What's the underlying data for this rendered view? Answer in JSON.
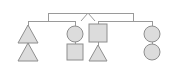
{
  "diagram": {
    "type": "genogram",
    "canvas": {
      "width": 177,
      "height": 68
    },
    "palette": {
      "background": "#ffffff",
      "shape_fill": "#dcdcdc",
      "shape_stroke": "#8e8e8e",
      "line_stroke": "#9a9a9a"
    },
    "apex": {
      "symbol": "∧",
      "name": "descent-apex",
      "x": 88,
      "y": 13,
      "half_width": 7,
      "height": 8
    },
    "top_bar": {
      "x1": 48,
      "x2": 133,
      "y": 13
    },
    "top_drops": [
      {
        "x": 48,
        "y1": 13,
        "y2": 21
      },
      {
        "x": 133,
        "y1": 13,
        "y2": 21
      }
    ],
    "sibling_bars": [
      {
        "name": "left-sibling-bar",
        "x1": 28,
        "x2": 75,
        "y": 21
      },
      {
        "name": "right-sibling-bar",
        "x1": 98,
        "x2": 152,
        "y": 21
      }
    ],
    "branches": [
      {
        "name": "branch-1",
        "x": 28,
        "stem": {
          "y1": 21,
          "y2": 30
        },
        "connector": {
          "y1": 38,
          "y2": 46
        },
        "top": {
          "shape": "triangle",
          "cx": 28,
          "cy": 34,
          "size": 9,
          "label": "triangle-node"
        },
        "bottom": {
          "shape": "triangle",
          "cx": 28,
          "cy": 52,
          "size": 9,
          "label": "triangle-node"
        }
      },
      {
        "name": "branch-2",
        "x": 75,
        "stem": {
          "y1": 21,
          "y2": 27
        },
        "connector": {
          "y1": 40,
          "y2": 44
        },
        "top": {
          "shape": "circle",
          "cx": 75,
          "cy": 34,
          "size": 8,
          "label": "circle-node"
        },
        "bottom": {
          "shape": "square",
          "cx": 75,
          "cy": 52,
          "size": 8,
          "label": "square-node"
        }
      },
      {
        "name": "branch-3",
        "x": 98,
        "stem": {
          "y1": 21,
          "y2": 26
        },
        "connector": {
          "y1": 41,
          "y2": 46
        },
        "top": {
          "shape": "square",
          "cx": 98,
          "cy": 33,
          "size": 9,
          "label": "square-node"
        },
        "bottom": {
          "shape": "triangle",
          "cx": 98,
          "cy": 53,
          "size": 8,
          "label": "triangle-node"
        }
      },
      {
        "name": "branch-4",
        "x": 152,
        "stem": {
          "y1": 21,
          "y2": 27
        },
        "connector": {
          "y1": 42,
          "y2": 44
        },
        "top": {
          "shape": "circle",
          "cx": 152,
          "cy": 34,
          "size": 8,
          "label": "circle-node"
        },
        "bottom": {
          "shape": "circle",
          "cx": 152,
          "cy": 52,
          "size": 8,
          "label": "circle-node"
        }
      }
    ]
  }
}
